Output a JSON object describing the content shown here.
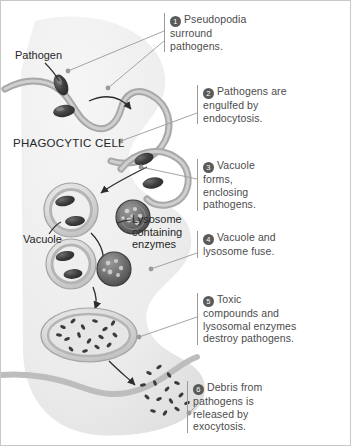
{
  "figure": {
    "background_color": "#ffffff",
    "ink_color": "#4c4c4c",
    "badge_color": "#5a5a5a",
    "cell_fill": "#e3e3e3",
    "membrane_color": "#a8a8a8",
    "pathogen_color": "#4a4a4a"
  },
  "labels": [
    {
      "id": "pathogen",
      "text": "Pathogen"
    },
    {
      "id": "phagocytic-cell",
      "text": "PHAGOCYTIC CELL"
    },
    {
      "id": "vacuole",
      "text": "Vacuole"
    },
    {
      "id": "lysosome",
      "text": "Lysosome containing enzymes"
    }
  ],
  "steps": [
    {
      "number": "1",
      "text": "Pseudopodia surround pathogens."
    },
    {
      "number": "2",
      "text": "Pathogens are engulfed by endocytosis."
    },
    {
      "number": "3",
      "text": "Vacuole forms, enclosing pathogens."
    },
    {
      "number": "4",
      "text": "Vacuole and lysosome fuse."
    },
    {
      "number": "5",
      "text": "Toxic compounds and lysosomal enzymes destroy pathogens."
    },
    {
      "number": "6",
      "text": "Debris from pathogens is released by exocytosis."
    }
  ]
}
